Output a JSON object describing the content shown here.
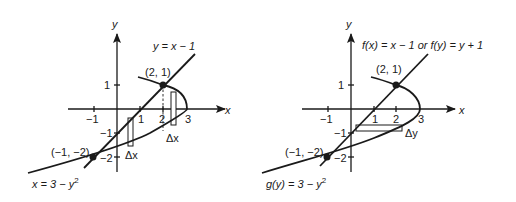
{
  "figures": [
    {
      "id": "left",
      "axis_x_label": "x",
      "axis_y_label": "y",
      "x_ticks": [
        "−1",
        "1",
        "2",
        "3"
      ],
      "y_ticks": [
        "1",
        "−1",
        "−2"
      ],
      "line_label": "y = x − 1",
      "curve_label_prefix": "x = 3 − ",
      "curve_label_var": "y",
      "curve_label_exp": "2",
      "points": [
        {
          "label": "(2, 1)",
          "x": 2,
          "y": 1
        },
        {
          "label": "(−1, −2)",
          "x": -1,
          "y": -2
        }
      ],
      "strip_labels": [
        "Δx",
        "Δx"
      ]
    },
    {
      "id": "right",
      "axis_x_label": "x",
      "axis_y_label": "y",
      "x_ticks": [
        "−1",
        "1",
        "2",
        "3"
      ],
      "y_ticks": [
        "1",
        "−1",
        "−2"
      ],
      "line_label": "f(x) = x − 1 or f(y) = y + 1",
      "curve_label_prefix": "g(y) = 3 − ",
      "curve_label_var": "y",
      "curve_label_exp": "2",
      "points": [
        {
          "label": "(2, 1)",
          "x": 2,
          "y": 1
        },
        {
          "label": "(−1, −2)",
          "x": -1,
          "y": -2
        }
      ],
      "strip_labels": [
        "Δy"
      ]
    }
  ]
}
